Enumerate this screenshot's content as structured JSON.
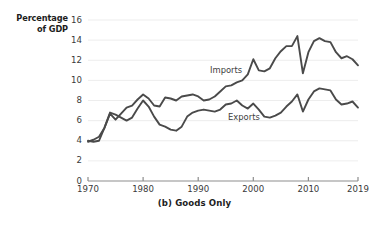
{
  "chart_data": {
    "type": "line",
    "title": "",
    "caption": "(b) Goods Only",
    "ylabel_line1": "Percentage",
    "ylabel_line2": "of GDP",
    "xlabel": "",
    "ylim": [
      0,
      16
    ],
    "xlim": [
      1970,
      2019
    ],
    "yticks": [
      0,
      2,
      4,
      6,
      8,
      10,
      12,
      14,
      16
    ],
    "ytick_labels": [
      "0",
      "2",
      "4",
      "6",
      "8",
      "10",
      "12",
      "14",
      "16"
    ],
    "xticks": [
      1970,
      1980,
      1990,
      2000,
      2010,
      2019
    ],
    "xtick_labels": [
      "1970",
      "1980",
      "1990",
      "2000",
      "2010",
      "2019"
    ],
    "grid": "horizontal",
    "grid_color": "#e8e8e8",
    "axis_color": "#8d8d8d",
    "line_color": "#4a4a4a",
    "line_width": 1.9,
    "legend_position": "inline-annotations",
    "x": [
      1970,
      1971,
      1972,
      1973,
      1974,
      1975,
      1976,
      1977,
      1978,
      1979,
      1980,
      1981,
      1982,
      1983,
      1984,
      1985,
      1986,
      1987,
      1988,
      1989,
      1990,
      1991,
      1992,
      1993,
      1994,
      1995,
      1996,
      1997,
      1998,
      1999,
      2000,
      2001,
      2002,
      2003,
      2004,
      2005,
      2006,
      2007,
      2008,
      2009,
      2010,
      2011,
      2012,
      2013,
      2014,
      2015,
      2016,
      2017,
      2018,
      2019
    ],
    "series": [
      {
        "name": "Imports",
        "label": "Imports",
        "values": [
          3.9,
          4.1,
          4.4,
          5.3,
          6.7,
          6.1,
          6.7,
          7.3,
          7.5,
          8.1,
          8.6,
          8.2,
          7.5,
          7.4,
          8.3,
          8.2,
          8.0,
          8.4,
          8.5,
          8.6,
          8.4,
          8.0,
          8.1,
          8.4,
          8.9,
          9.4,
          9.5,
          9.8,
          10.0,
          10.6,
          12.1,
          11.0,
          10.9,
          11.2,
          12.2,
          12.9,
          13.4,
          13.4,
          14.4,
          10.7,
          12.8,
          13.9,
          14.2,
          13.9,
          13.8,
          12.8,
          12.2,
          12.4,
          12.1,
          11.5
        ]
      },
      {
        "name": "Exports",
        "label": "Exports",
        "values": [
          4.0,
          3.9,
          4.0,
          5.3,
          6.8,
          6.6,
          6.3,
          6.0,
          6.3,
          7.2,
          8.0,
          7.4,
          6.4,
          5.6,
          5.4,
          5.1,
          5.0,
          5.4,
          6.4,
          6.8,
          7.0,
          7.1,
          7.0,
          6.9,
          7.1,
          7.6,
          7.7,
          8.0,
          7.5,
          7.2,
          7.7,
          7.1,
          6.4,
          6.3,
          6.5,
          6.8,
          7.4,
          7.9,
          8.6,
          6.9,
          8.1,
          8.9,
          9.2,
          9.1,
          9.0,
          8.1,
          7.6,
          7.7,
          7.9,
          7.3
        ]
      }
    ]
  }
}
